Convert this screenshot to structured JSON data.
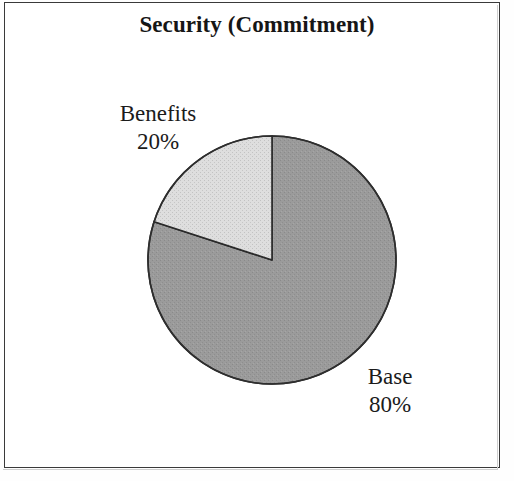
{
  "chart_data": {
    "type": "pie",
    "title": "Security (Commitment)",
    "xlabel": "",
    "ylabel": "",
    "legend": "none",
    "grid": false,
    "categories": [
      "Base",
      "Benefits"
    ],
    "values": [
      80,
      20
    ],
    "units": "percent",
    "slices": [
      {
        "name": "Benefits",
        "label": "Benefits",
        "value": 20,
        "value_label": "20%",
        "color": "#d8d8d8",
        "start_angle_deg": 0,
        "sweep_deg": 72,
        "direction": "counter-clockwise",
        "label_position": "upper-left"
      },
      {
        "name": "Base",
        "label": "Base",
        "value": 80,
        "value_label": "80%",
        "color": "#989898",
        "start_angle_deg": 0,
        "sweep_deg": 288,
        "direction": "clockwise",
        "label_position": "lower-right"
      }
    ],
    "start_angle_note": "first boundary at 12 o'clock",
    "outline_color": "#2a2a2a"
  },
  "figure": {
    "title": "Security (Commitment)",
    "border_color": "#3a3a3a",
    "background": "#ffffff"
  },
  "labels": {
    "benefits": {
      "name": "Benefits",
      "percent": "20%"
    },
    "base": {
      "name": "Base",
      "percent": "80%"
    }
  }
}
